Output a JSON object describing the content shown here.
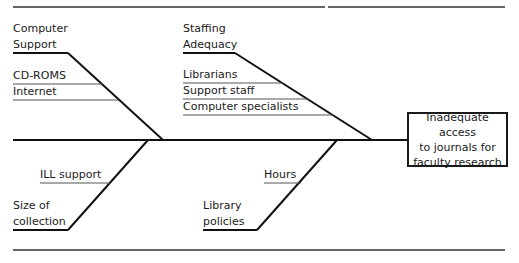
{
  "diagram": {
    "type": "fishbone",
    "effect": "Inadequate access to journals for faculty research",
    "effect_lines": [
      "Inadequate access",
      "to journals for",
      "faculty research"
    ],
    "categories": [
      {
        "name_lines": [
          "Computer",
          "Support"
        ],
        "name": "Computer Support",
        "position": "top-left",
        "causes": [
          "CD-ROMS",
          "Internet"
        ]
      },
      {
        "name_lines": [
          "Staffing",
          "Adequacy"
        ],
        "name": "Staffing Adequacy",
        "position": "top-right",
        "causes": [
          "Librarians",
          "Support staff",
          "Computer specialists"
        ]
      },
      {
        "name_lines": [
          "Size of",
          "collection"
        ],
        "name": "Size of collection",
        "position": "bottom-left",
        "causes": [
          "ILL support"
        ]
      },
      {
        "name_lines": [
          "Library",
          "policies"
        ],
        "name": "Library policies",
        "position": "bottom-right",
        "causes": [
          "Hours"
        ]
      }
    ]
  }
}
